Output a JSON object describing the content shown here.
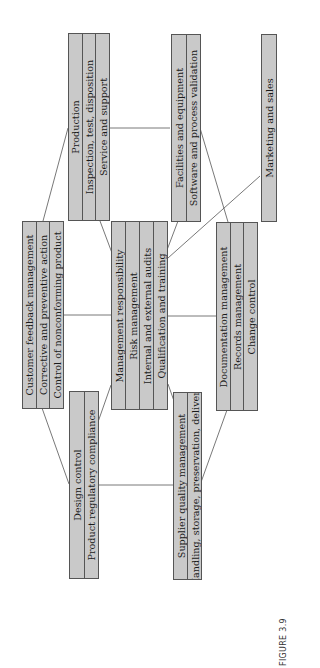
{
  "diagram": {
    "boxes": {
      "production": [
        "Production",
        "Inspection, test, disposition",
        "Service and support"
      ],
      "facilities": [
        "Facilities and equipment",
        "Software and process validation"
      ],
      "marketing": [
        "Marketing and sales"
      ],
      "customer": [
        "Customer feedback management",
        "Corrective and preventive action",
        "Control of nonconforming product"
      ],
      "management": [
        "Management responsibility",
        "Risk management",
        "Internal and external audits",
        "Qualification and training"
      ],
      "documentation": [
        "Documentation management",
        "Records management",
        "Change control"
      ],
      "design": [
        "Design control",
        "Product regulatory compliance"
      ],
      "supplier": [
        "Supplier quality management",
        "Handling, storage, preservation, delivery"
      ]
    },
    "connections": [
      [
        "production",
        "customer"
      ],
      [
        "production",
        "facilities"
      ],
      [
        "production",
        "management"
      ],
      [
        "facilities",
        "documentation"
      ],
      [
        "facilities",
        "management"
      ],
      [
        "marketing",
        "management"
      ],
      [
        "customer",
        "management"
      ],
      [
        "management",
        "documentation"
      ],
      [
        "customer",
        "design"
      ],
      [
        "management",
        "design"
      ],
      [
        "management",
        "supplier"
      ],
      [
        "design",
        "supplier"
      ],
      [
        "documentation",
        "supplier"
      ]
    ],
    "colors": {
      "box_fill": "#c9c9c9",
      "border": "#555555"
    }
  },
  "caption": {
    "label": "FIGURE 3.9"
  }
}
